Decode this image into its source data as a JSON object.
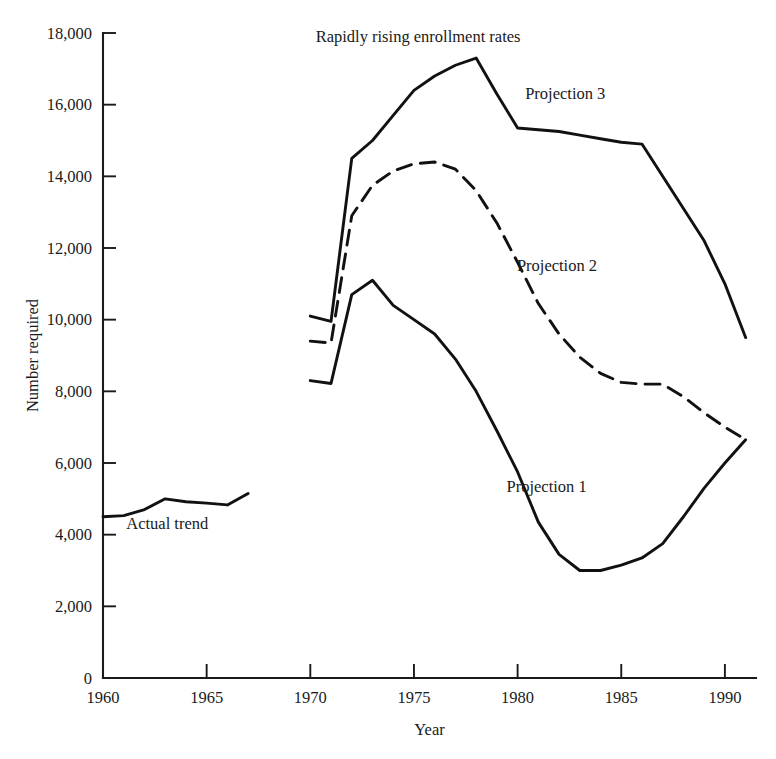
{
  "chart_data": {
    "type": "line",
    "title": "",
    "xlabel": "Year",
    "ylabel": "Number required",
    "xlim": [
      1960,
      1991.5
    ],
    "ylim": [
      0,
      18000
    ],
    "grid": false,
    "legend_position": "inline-annotations",
    "x_ticks": [
      1960,
      1965,
      1970,
      1975,
      1980,
      1985,
      1990
    ],
    "x_tick_labels": [
      "1960",
      "1965",
      "1970",
      "1975",
      "1980",
      "1985",
      "1990"
    ],
    "y_ticks": [
      0,
      2000,
      4000,
      6000,
      8000,
      10000,
      12000,
      14000,
      16000,
      18000
    ],
    "y_tick_labels": [
      "0",
      "2,000",
      "4,000",
      "6,000",
      "8,000",
      "10,000",
      "12,000",
      "14,000",
      "16,000",
      "18,000"
    ],
    "annotations": [
      {
        "text": "Rapidly rising enrollment rates",
        "x": 1975.2,
        "y": 17750
      },
      {
        "text": "Actual trend",
        "x": 1963.1,
        "y": 4150
      },
      {
        "text": "Projection 3",
        "x": 1982.3,
        "y": 16150
      },
      {
        "text": "Projection 2",
        "x": 1981.9,
        "y": 11350
      },
      {
        "text": "Projection 1",
        "x": 1981.4,
        "y": 5200
      }
    ],
    "series": [
      {
        "name": "Actual trend",
        "style": "solid",
        "x": [
          1960,
          1961,
          1962,
          1963,
          1964,
          1965,
          1966,
          1967
        ],
        "values": [
          4500,
          4530,
          4700,
          5000,
          4920,
          4880,
          4830,
          5150
        ]
      },
      {
        "name": "Projection 1",
        "style": "solid",
        "x": [
          1970,
          1971,
          1972,
          1973,
          1974,
          1975,
          1976,
          1977,
          1978,
          1979,
          1980,
          1981,
          1982,
          1983,
          1984,
          1985,
          1986,
          1987,
          1988,
          1989,
          1990,
          1991
        ],
        "values": [
          8300,
          8220,
          10700,
          11100,
          10400,
          10000,
          9600,
          8900,
          8000,
          6900,
          5750,
          4350,
          3450,
          3000,
          3000,
          3150,
          3350,
          3750,
          4500,
          5300,
          6000,
          6650
        ]
      },
      {
        "name": "Projection 2",
        "style": "dashed",
        "x": [
          1970,
          1971,
          1972,
          1973,
          1974,
          1975,
          1976,
          1977,
          1978,
          1979,
          1980,
          1981,
          1982,
          1983,
          1984,
          1985,
          1986,
          1987,
          1988,
          1989,
          1990,
          1991
        ],
        "values": [
          9400,
          9350,
          12900,
          13750,
          14150,
          14350,
          14400,
          14200,
          13600,
          12700,
          11600,
          10450,
          9600,
          8950,
          8500,
          8250,
          8200,
          8200,
          7850,
          7400,
          7000,
          6650
        ]
      },
      {
        "name": "Projection 3",
        "style": "solid",
        "x": [
          1970,
          1971,
          1972,
          1973,
          1974,
          1975,
          1976,
          1977,
          1978,
          1979,
          1980,
          1981,
          1982,
          1983,
          1984,
          1985,
          1986,
          1987,
          1988,
          1989,
          1990,
          1991
        ],
        "values": [
          10100,
          9950,
          14500,
          15000,
          15700,
          16400,
          16800,
          17100,
          17300,
          16300,
          15350,
          15300,
          15250,
          15150,
          15050,
          14950,
          14900,
          14000,
          13100,
          12200,
          11000,
          9500
        ]
      }
    ]
  }
}
